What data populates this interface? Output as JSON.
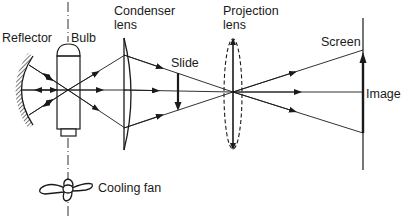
{
  "diagram": {
    "labels": {
      "reflector": "Reflector",
      "bulb": "Bulb",
      "condenser_line1": "Condenser",
      "condenser_line2": "lens",
      "slide": "Slide",
      "projection_line1": "Projection",
      "projection_line2": "lens",
      "screen": "Screen",
      "image": "Image",
      "cooling_fan": "Cooling fan"
    },
    "colors": {
      "ink": "#1a1a1a",
      "background": "#ffffff"
    },
    "components": [
      {
        "name": "Reflector",
        "type": "concave mirror"
      },
      {
        "name": "Bulb",
        "type": "light source"
      },
      {
        "name": "Condenser lens",
        "type": "plano-convex lens"
      },
      {
        "name": "Slide",
        "type": "object (inverted arrow)"
      },
      {
        "name": "Projection lens",
        "type": "convex lens"
      },
      {
        "name": "Screen",
        "type": "projection surface"
      },
      {
        "name": "Image",
        "type": "upright enlarged image"
      },
      {
        "name": "Cooling fan",
        "type": "fan"
      }
    ]
  }
}
